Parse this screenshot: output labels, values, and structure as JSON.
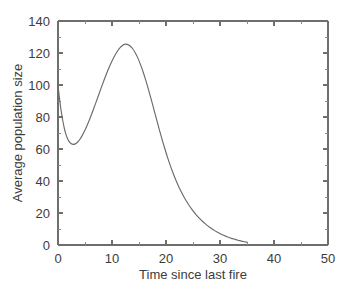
{
  "chart_data": {
    "type": "line",
    "title": "",
    "xlabel": "Time since last fire",
    "ylabel": "Average population size",
    "xlim": [
      0,
      50
    ],
    "ylim": [
      0,
      140
    ],
    "grid": false,
    "legend": null,
    "x_ticks": [
      0,
      10,
      20,
      30,
      40,
      50
    ],
    "x_tick_labels": [
      "0",
      "10",
      "20",
      "30",
      "40",
      "50"
    ],
    "x_minor_ticks": [
      5,
      15,
      25,
      35,
      45
    ],
    "y_ticks": [
      0,
      20,
      40,
      60,
      80,
      100,
      120,
      140
    ],
    "y_tick_labels": [
      "0",
      "20",
      "40",
      "60",
      "80",
      "100",
      "120",
      "140"
    ],
    "y_minor_ticks": [
      10,
      30,
      50,
      70,
      90,
      110,
      130
    ],
    "series": [
      {
        "name": "Average population size",
        "color": "#6b6b6b",
        "x_start": 0,
        "x_end": 35,
        "points": [
          [
            0.0,
            100.0
          ],
          [
            0.3,
            91.0
          ],
          [
            0.6,
            83.5
          ],
          [
            0.9,
            77.5
          ],
          [
            1.2,
            72.5
          ],
          [
            1.5,
            68.8
          ],
          [
            1.8,
            66.2
          ],
          [
            2.1,
            64.4
          ],
          [
            2.4,
            63.4
          ],
          [
            2.8,
            62.9
          ],
          [
            3.2,
            63.2
          ],
          [
            3.6,
            64.2
          ],
          [
            4.0,
            65.8
          ],
          [
            4.5,
            68.5
          ],
          [
            5.0,
            71.8
          ],
          [
            5.5,
            75.6
          ],
          [
            6.0,
            79.8
          ],
          [
            6.5,
            84.2
          ],
          [
            7.0,
            88.8
          ],
          [
            7.5,
            93.5
          ],
          [
            8.0,
            98.2
          ],
          [
            8.5,
            102.8
          ],
          [
            9.0,
            107.2
          ],
          [
            9.5,
            111.3
          ],
          [
            10.0,
            115.0
          ],
          [
            10.5,
            118.3
          ],
          [
            11.0,
            121.1
          ],
          [
            11.5,
            123.3
          ],
          [
            12.0,
            124.8
          ],
          [
            12.3,
            125.4
          ],
          [
            12.8,
            125.4
          ],
          [
            13.3,
            124.5
          ],
          [
            13.8,
            122.8
          ],
          [
            14.3,
            120.2
          ],
          [
            14.8,
            116.8
          ],
          [
            15.3,
            112.6
          ],
          [
            15.8,
            107.8
          ],
          [
            16.3,
            102.4
          ],
          [
            16.8,
            96.6
          ],
          [
            17.3,
            90.5
          ],
          [
            17.8,
            84.2
          ],
          [
            18.3,
            77.9
          ],
          [
            18.8,
            71.7
          ],
          [
            19.3,
            65.7
          ],
          [
            19.8,
            60.0
          ],
          [
            20.3,
            54.6
          ],
          [
            20.8,
            49.6
          ],
          [
            21.3,
            45.0
          ],
          [
            21.8,
            40.8
          ],
          [
            22.3,
            36.9
          ],
          [
            22.8,
            33.4
          ],
          [
            23.3,
            30.2
          ],
          [
            23.8,
            27.3
          ],
          [
            24.3,
            24.7
          ],
          [
            24.8,
            22.3
          ],
          [
            25.3,
            20.1
          ],
          [
            25.8,
            18.1
          ],
          [
            26.3,
            16.3
          ],
          [
            26.8,
            14.7
          ],
          [
            27.3,
            13.2
          ],
          [
            27.8,
            11.8
          ],
          [
            28.3,
            10.6
          ],
          [
            28.8,
            9.5
          ],
          [
            29.3,
            8.4
          ],
          [
            29.8,
            7.5
          ],
          [
            30.3,
            6.6
          ],
          [
            30.8,
            5.9
          ],
          [
            31.3,
            5.2
          ],
          [
            31.8,
            4.5
          ],
          [
            32.3,
            4.0
          ],
          [
            32.8,
            3.5
          ],
          [
            33.3,
            3.0
          ],
          [
            33.8,
            2.6
          ],
          [
            34.3,
            2.2
          ],
          [
            34.8,
            1.9
          ],
          [
            35.0,
            1.8
          ]
        ],
        "annotations": {
          "initial_value": 100,
          "trough_x": 2.9,
          "trough_y": 62.9,
          "peak_x": 12.5,
          "peak_y": 125.5,
          "final_x": 35,
          "final_y": 1.8
        }
      }
    ]
  }
}
